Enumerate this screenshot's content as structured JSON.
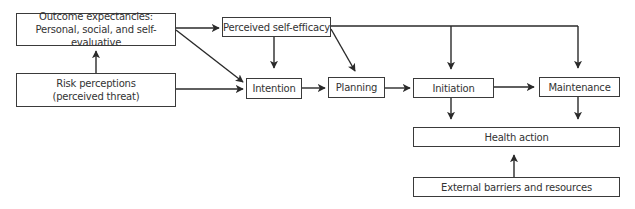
{
  "diagram": {
    "type": "flowchart",
    "nodes": {
      "outcome": {
        "line1": "Outcome expectancies:",
        "line2": "Personal, social, and self-evaluative"
      },
      "risk": {
        "line1": "Risk perceptions",
        "line2": "(perceived threat)"
      },
      "self_efficacy": {
        "label": "Perceived self-efficacy"
      },
      "intention": {
        "label": "Intention"
      },
      "planning": {
        "label": "Planning"
      },
      "initiation": {
        "label": "Initiation"
      },
      "maintenance": {
        "label": "Maintenance"
      },
      "health_action": {
        "label": "Health action"
      },
      "external": {
        "label": "External barriers and resources"
      }
    },
    "edges": [
      {
        "from": "risk",
        "to": "outcome"
      },
      {
        "from": "outcome",
        "to": "self_efficacy"
      },
      {
        "from": "outcome",
        "to": "intention"
      },
      {
        "from": "risk",
        "to": "intention"
      },
      {
        "from": "self_efficacy",
        "to": "intention"
      },
      {
        "from": "self_efficacy",
        "to": "planning"
      },
      {
        "from": "self_efficacy",
        "to": "initiation"
      },
      {
        "from": "self_efficacy",
        "to": "maintenance"
      },
      {
        "from": "intention",
        "to": "planning"
      },
      {
        "from": "planning",
        "to": "initiation"
      },
      {
        "from": "initiation",
        "to": "maintenance"
      },
      {
        "from": "initiation",
        "to": "health_action"
      },
      {
        "from": "maintenance",
        "to": "health_action"
      },
      {
        "from": "external",
        "to": "health_action"
      }
    ]
  }
}
